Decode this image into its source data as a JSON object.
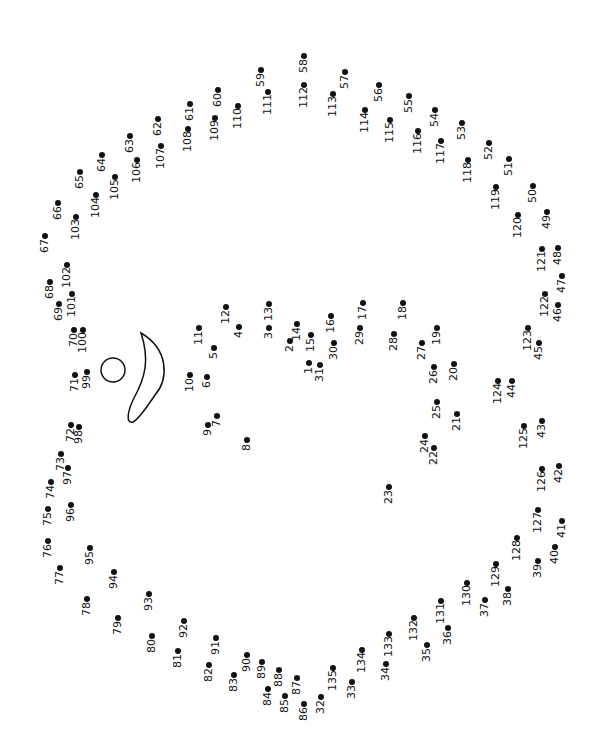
{
  "colors": {
    "ink": "#111111",
    "paper": "#ffffff"
  },
  "shapes": [
    {
      "type": "circle",
      "name": "eye-circle",
      "cx": 113,
      "cy": 370,
      "r": 12
    },
    {
      "type": "teardrop",
      "name": "crescent-shape"
    }
  ],
  "dots": [
    {
      "n": "1",
      "x": 309,
      "y": 363
    },
    {
      "n": "2",
      "x": 290,
      "y": 341
    },
    {
      "n": "3",
      "x": 269,
      "y": 328
    },
    {
      "n": "4",
      "x": 239,
      "y": 327
    },
    {
      "n": "5",
      "x": 214,
      "y": 348
    },
    {
      "n": "6",
      "x": 207,
      "y": 377
    },
    {
      "n": "7",
      "x": 217,
      "y": 416
    },
    {
      "n": "8",
      "x": 247,
      "y": 440
    },
    {
      "n": "9",
      "x": 208,
      "y": 425
    },
    {
      "n": "10",
      "x": 190,
      "y": 375
    },
    {
      "n": "11",
      "x": 199,
      "y": 328
    },
    {
      "n": "12",
      "x": 226,
      "y": 307
    },
    {
      "n": "13",
      "x": 269,
      "y": 304
    },
    {
      "n": "14",
      "x": 297,
      "y": 324
    },
    {
      "n": "15",
      "x": 311,
      "y": 335
    },
    {
      "n": "16",
      "x": 331,
      "y": 316
    },
    {
      "n": "17",
      "x": 363,
      "y": 303
    },
    {
      "n": "18",
      "x": 403,
      "y": 303
    },
    {
      "n": "19",
      "x": 437,
      "y": 328
    },
    {
      "n": "20",
      "x": 454,
      "y": 364
    },
    {
      "n": "21",
      "x": 457,
      "y": 414
    },
    {
      "n": "22",
      "x": 434,
      "y": 448
    },
    {
      "n": "23",
      "x": 389,
      "y": 487
    },
    {
      "n": "24",
      "x": 425,
      "y": 436
    },
    {
      "n": "25",
      "x": 437,
      "y": 402
    },
    {
      "n": "26",
      "x": 434,
      "y": 367
    },
    {
      "n": "27",
      "x": 422,
      "y": 343
    },
    {
      "n": "28",
      "x": 394,
      "y": 334
    },
    {
      "n": "29",
      "x": 360,
      "y": 328
    },
    {
      "n": "30",
      "x": 334,
      "y": 343
    },
    {
      "n": "31",
      "x": 320,
      "y": 365
    },
    {
      "n": "32",
      "x": 321,
      "y": 697
    },
    {
      "n": "33",
      "x": 352,
      "y": 682
    },
    {
      "n": "34",
      "x": 386,
      "y": 664
    },
    {
      "n": "35",
      "x": 427,
      "y": 645
    },
    {
      "n": "36",
      "x": 448,
      "y": 628
    },
    {
      "n": "37",
      "x": 485,
      "y": 600
    },
    {
      "n": "38",
      "x": 508,
      "y": 589
    },
    {
      "n": "39",
      "x": 538,
      "y": 561
    },
    {
      "n": "40",
      "x": 555,
      "y": 547
    },
    {
      "n": "41",
      "x": 562,
      "y": 521
    },
    {
      "n": "42",
      "x": 559,
      "y": 466
    },
    {
      "n": "43",
      "x": 542,
      "y": 421
    },
    {
      "n": "44",
      "x": 512,
      "y": 381
    },
    {
      "n": "45",
      "x": 539,
      "y": 343
    },
    {
      "n": "46",
      "x": 558,
      "y": 305
    },
    {
      "n": "47",
      "x": 562,
      "y": 276
    },
    {
      "n": "48",
      "x": 558,
      "y": 248
    },
    {
      "n": "49",
      "x": 547,
      "y": 212
    },
    {
      "n": "50",
      "x": 533,
      "y": 186
    },
    {
      "n": "51",
      "x": 509,
      "y": 159
    },
    {
      "n": "52",
      "x": 489,
      "y": 143
    },
    {
      "n": "53",
      "x": 462,
      "y": 123
    },
    {
      "n": "54",
      "x": 435,
      "y": 110
    },
    {
      "n": "55",
      "x": 409,
      "y": 96
    },
    {
      "n": "56",
      "x": 379,
      "y": 85
    },
    {
      "n": "57",
      "x": 345,
      "y": 72
    },
    {
      "n": "58",
      "x": 304,
      "y": 56
    },
    {
      "n": "59",
      "x": 261,
      "y": 70
    },
    {
      "n": "60",
      "x": 218,
      "y": 90
    },
    {
      "n": "61",
      "x": 190,
      "y": 104
    },
    {
      "n": "62",
      "x": 158,
      "y": 119
    },
    {
      "n": "63",
      "x": 130,
      "y": 136
    },
    {
      "n": "64",
      "x": 102,
      "y": 155
    },
    {
      "n": "65",
      "x": 80,
      "y": 172
    },
    {
      "n": "66",
      "x": 58,
      "y": 203
    },
    {
      "n": "67",
      "x": 45,
      "y": 236
    },
    {
      "n": "68",
      "x": 50,
      "y": 282
    },
    {
      "n": "69",
      "x": 59,
      "y": 304
    },
    {
      "n": "70",
      "x": 74,
      "y": 330
    },
    {
      "n": "71",
      "x": 75,
      "y": 375
    },
    {
      "n": "72",
      "x": 71,
      "y": 425
    },
    {
      "n": "73",
      "x": 61,
      "y": 454
    },
    {
      "n": "74",
      "x": 51,
      "y": 482
    },
    {
      "n": "75",
      "x": 48,
      "y": 509
    },
    {
      "n": "76",
      "x": 48,
      "y": 541
    },
    {
      "n": "77",
      "x": 60,
      "y": 568
    },
    {
      "n": "78",
      "x": 87,
      "y": 599
    },
    {
      "n": "79",
      "x": 118,
      "y": 618
    },
    {
      "n": "80",
      "x": 152,
      "y": 636
    },
    {
      "n": "81",
      "x": 178,
      "y": 651
    },
    {
      "n": "82",
      "x": 209,
      "y": 665
    },
    {
      "n": "83",
      "x": 234,
      "y": 675
    },
    {
      "n": "84",
      "x": 268,
      "y": 689
    },
    {
      "n": "85",
      "x": 285,
      "y": 696
    },
    {
      "n": "86",
      "x": 304,
      "y": 704
    },
    {
      "n": "87",
      "x": 297,
      "y": 678
    },
    {
      "n": "88",
      "x": 279,
      "y": 670
    },
    {
      "n": "89",
      "x": 262,
      "y": 662
    },
    {
      "n": "90",
      "x": 247,
      "y": 655
    },
    {
      "n": "91",
      "x": 216,
      "y": 638
    },
    {
      "n": "92",
      "x": 184,
      "y": 621
    },
    {
      "n": "93",
      "x": 149,
      "y": 594
    },
    {
      "n": "94",
      "x": 114,
      "y": 572
    },
    {
      "n": "95",
      "x": 90,
      "y": 548
    },
    {
      "n": "96",
      "x": 71,
      "y": 505
    },
    {
      "n": "97",
      "x": 68,
      "y": 468
    },
    {
      "n": "98",
      "x": 79,
      "y": 427
    },
    {
      "n": "99",
      "x": 87,
      "y": 372
    },
    {
      "n": "100",
      "x": 83,
      "y": 330
    },
    {
      "n": "101",
      "x": 72,
      "y": 294
    },
    {
      "n": "102",
      "x": 67,
      "y": 265
    },
    {
      "n": "103",
      "x": 76,
      "y": 217
    },
    {
      "n": "104",
      "x": 96,
      "y": 195
    },
    {
      "n": "105",
      "x": 115,
      "y": 177
    },
    {
      "n": "106",
      "x": 137,
      "y": 160
    },
    {
      "n": "107",
      "x": 161,
      "y": 146
    },
    {
      "n": "108",
      "x": 188,
      "y": 129
    },
    {
      "n": "109",
      "x": 215,
      "y": 118
    },
    {
      "n": "110",
      "x": 238,
      "y": 106
    },
    {
      "n": "111",
      "x": 268,
      "y": 92
    },
    {
      "n": "112",
      "x": 304,
      "y": 85
    },
    {
      "n": "113",
      "x": 333,
      "y": 94
    },
    {
      "n": "114",
      "x": 365,
      "y": 110
    },
    {
      "n": "115",
      "x": 390,
      "y": 120
    },
    {
      "n": "116",
      "x": 418,
      "y": 131
    },
    {
      "n": "117",
      "x": 441,
      "y": 141
    },
    {
      "n": "118",
      "x": 468,
      "y": 160
    },
    {
      "n": "119",
      "x": 496,
      "y": 187
    },
    {
      "n": "120",
      "x": 518,
      "y": 215
    },
    {
      "n": "121",
      "x": 542,
      "y": 249
    },
    {
      "n": "122",
      "x": 545,
      "y": 294
    },
    {
      "n": "123",
      "x": 528,
      "y": 328
    },
    {
      "n": "124",
      "x": 498,
      "y": 381
    },
    {
      "n": "125",
      "x": 524,
      "y": 426
    },
    {
      "n": "126",
      "x": 542,
      "y": 469
    },
    {
      "n": "127",
      "x": 538,
      "y": 510
    },
    {
      "n": "128",
      "x": 517,
      "y": 538
    },
    {
      "n": "129",
      "x": 496,
      "y": 564
    },
    {
      "n": "130",
      "x": 467,
      "y": 583
    },
    {
      "n": "131",
      "x": 441,
      "y": 601
    },
    {
      "n": "132",
      "x": 414,
      "y": 618
    },
    {
      "n": "133",
      "x": 389,
      "y": 634
    },
    {
      "n": "134",
      "x": 362,
      "y": 650
    },
    {
      "n": "135",
      "x": 333,
      "y": 668
    }
  ]
}
